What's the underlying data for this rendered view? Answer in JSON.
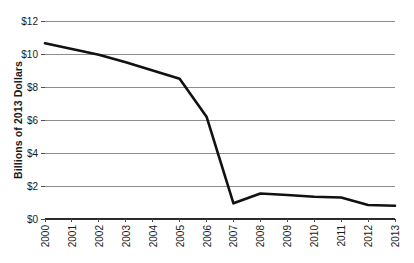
{
  "chart_data": {
    "type": "line",
    "title": "",
    "subtitle": "",
    "xlabel": "",
    "ylabel": "Billions of 2013 Dollars",
    "categories": [
      "2000",
      "2001",
      "2002",
      "2003",
      "2004",
      "2005",
      "2006",
      "2007",
      "2008",
      "2009",
      "2010",
      "2011",
      "2012",
      "2013"
    ],
    "x": [
      2000,
      2001,
      2002,
      2003,
      2004,
      2005,
      2006,
      2007,
      2008,
      2009,
      2010,
      2011,
      2012,
      2013
    ],
    "values": [
      10.65,
      10.3,
      9.95,
      9.5,
      9.0,
      8.5,
      6.2,
      0.95,
      1.55,
      1.45,
      1.35,
      1.3,
      0.85,
      0.8
    ],
    "series": [
      {
        "name": "",
        "values": [
          10.65,
          10.3,
          9.95,
          9.5,
          9.0,
          8.5,
          6.2,
          0.95,
          1.55,
          1.45,
          1.35,
          1.3,
          0.85,
          0.8
        ]
      }
    ],
    "ylim": [
      0,
      12
    ],
    "ytick_values": [
      0,
      2,
      4,
      6,
      8,
      10,
      12
    ],
    "ytick_labels": [
      "$0",
      "$2",
      "$4",
      "$6",
      "$8",
      "$10",
      "$12"
    ],
    "xtick_labels": [
      "2000",
      "2001",
      "2002",
      "2003",
      "2004",
      "2005",
      "2006",
      "2007",
      "2008",
      "2009",
      "2010",
      "2011",
      "2012",
      "2013"
    ],
    "xtick_label_rotation": -90,
    "grid": true,
    "grid_axis": "y",
    "legend": false,
    "legend_position": "none",
    "annotations": [],
    "colors": {
      "line": "#111111",
      "grid": "#8c8c8c",
      "baseline": "#2b2b2b",
      "background": "#ffffff",
      "text": "#1a1a1a"
    }
  },
  "layout": {
    "width": 414,
    "height": 263,
    "plot_left": 45,
    "plot_right": 395,
    "plot_top": 21,
    "plot_bottom": 219
  }
}
